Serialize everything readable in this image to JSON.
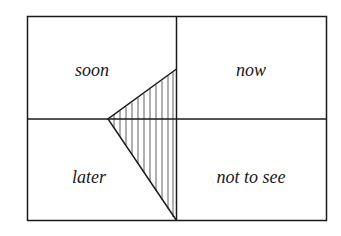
{
  "diagram": {
    "quadrants": {
      "top_left": "soon",
      "top_right": "now",
      "bottom_left": "later",
      "bottom_right": "not to see"
    },
    "shape": "hatched-triangle",
    "colors": {
      "stroke": "#1a1a1a",
      "background": "#ffffff"
    }
  }
}
